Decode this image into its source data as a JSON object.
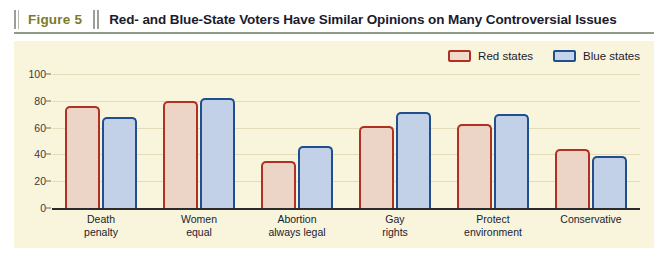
{
  "header": {
    "figure_number": "Figure 5",
    "title": "Red- and Blue-State Voters Have Similar Opinions on Many Controversial Issues"
  },
  "legend": {
    "items": [
      {
        "label": "Red states",
        "color": "#b03024",
        "fill": "#ecd4c6"
      },
      {
        "label": "Blue states",
        "color": "#1f4f8f",
        "fill": "#c3d1e8"
      }
    ]
  },
  "axis": {
    "y_ticks": [
      "100",
      "80",
      "60",
      "40",
      "20",
      "0"
    ]
  },
  "categories_display": [
    {
      "line1": "Death",
      "line2": "penalty"
    },
    {
      "line1": "Women",
      "line2": "equal"
    },
    {
      "line1": "Abortion",
      "line2": "always legal"
    },
    {
      "line1": "Gay",
      "line2": "rights"
    },
    {
      "line1": "Protect",
      "line2": "environment"
    },
    {
      "line1": "Conservative",
      "line2": ""
    }
  ],
  "chart_data": {
    "type": "bar",
    "title": "Red- and Blue-State Voters Have Similar Opinions on Many Controversial Issues",
    "xlabel": "",
    "ylabel": "",
    "ylim": [
      0,
      100
    ],
    "yticks": [
      0,
      20,
      40,
      60,
      80,
      100
    ],
    "grid": true,
    "legend_position": "top-right",
    "categories": [
      "Death penalty",
      "Women equal",
      "Abortion always legal",
      "Gay rights",
      "Protect environment",
      "Conservative"
    ],
    "series": [
      {
        "name": "Red states",
        "color": "#b03024",
        "fill": "#ecd4c6",
        "values": [
          76,
          80,
          35,
          61,
          63,
          44
        ]
      },
      {
        "name": "Blue states",
        "color": "#1f4f8f",
        "fill": "#c3d1e8",
        "values": [
          68,
          82,
          46,
          72,
          70,
          39
        ]
      }
    ]
  }
}
